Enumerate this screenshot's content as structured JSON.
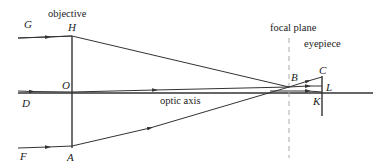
{
  "diagram": {
    "colors": {
      "line": "#333333",
      "dash": "#aaaaaa",
      "text": "#222222"
    },
    "labels": {
      "objective": "objective",
      "focal_plane": "focal plane",
      "eyepiece": "eyepiece",
      "optic_axis": "optic axis"
    },
    "points": {
      "G": "G",
      "H": "H",
      "O": "O",
      "D": "D",
      "F": "F",
      "A": "A",
      "B": "B",
      "C": "C",
      "L": "L",
      "K": "K"
    }
  }
}
